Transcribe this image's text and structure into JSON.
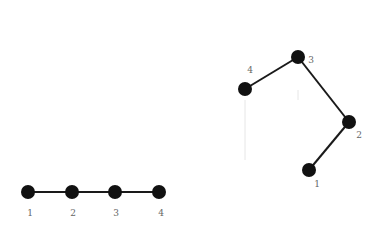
{
  "diagrams": [
    {
      "name": "linear-chain",
      "nodes": [
        {
          "id": "1",
          "label": "1",
          "x": 28,
          "y": 192,
          "lx": 30,
          "ly": 216
        },
        {
          "id": "2",
          "label": "2",
          "x": 72,
          "y": 192,
          "lx": 73,
          "ly": 216
        },
        {
          "id": "3",
          "label": "3",
          "x": 115,
          "y": 192,
          "lx": 116,
          "ly": 216
        },
        {
          "id": "4",
          "label": "4",
          "x": 159,
          "y": 192,
          "lx": 161,
          "ly": 216
        }
      ],
      "edges": [
        [
          "1",
          "2"
        ],
        [
          "2",
          "3"
        ],
        [
          "3",
          "4"
        ]
      ]
    },
    {
      "name": "folded-chain",
      "nodes": [
        {
          "id": "1",
          "label": "1",
          "x": 309,
          "y": 170,
          "lx": 317,
          "ly": 187
        },
        {
          "id": "2",
          "label": "2",
          "x": 349,
          "y": 122,
          "lx": 359,
          "ly": 138
        },
        {
          "id": "3",
          "label": "3",
          "x": 298,
          "y": 57,
          "lx": 311,
          "ly": 63
        },
        {
          "id": "4",
          "label": "4",
          "x": 245,
          "y": 89,
          "lx": 250,
          "ly": 73
        }
      ],
      "edges": [
        [
          "1",
          "2"
        ],
        [
          "2",
          "3"
        ],
        [
          "3",
          "4"
        ]
      ]
    }
  ],
  "colors": {
    "node": "#111111",
    "edge": "#1a1a1a",
    "label": "#666666"
  }
}
